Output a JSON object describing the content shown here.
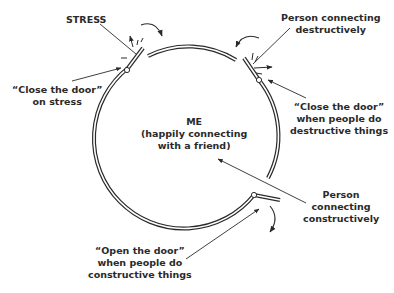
{
  "diagram": {
    "center": {
      "title": "ME",
      "line2": "(happily connecting",
      "line3": "with a friend)"
    },
    "labels": {
      "stress": "STRESS",
      "close_door_stress": [
        "“Close the door”",
        "on stress"
      ],
      "person_destructive": [
        "Person connecting",
        "destructively"
      ],
      "close_door_destructive": [
        "“Close the door”",
        "when people do",
        "destructive things"
      ],
      "person_constructive": [
        "Person",
        "connecting",
        "constructively"
      ],
      "open_door_constructive": [
        "“Open the door”",
        "when people do",
        "constructive things"
      ]
    },
    "colors": {
      "stroke": "#2a2a2a",
      "background": "#ffffff"
    }
  }
}
